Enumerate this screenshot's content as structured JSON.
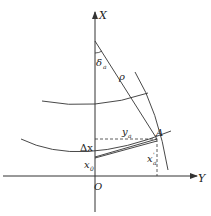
{
  "diagram": {
    "axes": {
      "x_axis_label": "X",
      "y_axis_label": "Y",
      "origin_label": "O"
    },
    "labels": {
      "angle": "δ",
      "angle_sub": "a",
      "radius": "ρ",
      "point": "A",
      "y_coord": "y",
      "y_coord_sub": "a",
      "x_coord": "x",
      "x_coord_sub": "a",
      "x_coord_sup": "'",
      "delta_x": "Δx",
      "x0": "x",
      "x0_sub": "0"
    },
    "colors": {
      "stroke": "#333333",
      "background": "#ffffff"
    }
  }
}
